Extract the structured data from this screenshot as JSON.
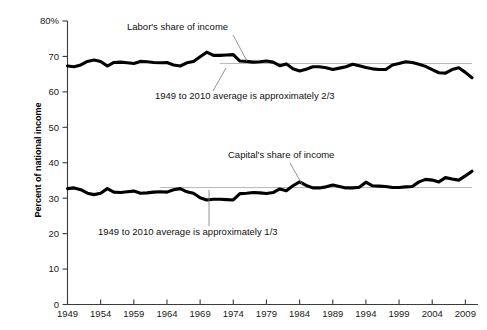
{
  "chart_data": {
    "type": "line",
    "title": "",
    "xlabel": "",
    "ylabel": "Percent of national income",
    "xlim": [
      1949,
      2010
    ],
    "ylim": [
      0,
      80
    ],
    "grid": false,
    "legend_position": "inline-annotations",
    "ytick_labels": [
      "0",
      "10",
      "20",
      "30",
      "40",
      "50",
      "60",
      "70",
      "80%"
    ],
    "ytick_values": [
      0,
      10,
      20,
      30,
      40,
      50,
      60,
      70,
      80
    ],
    "xtick_labels": [
      "1949",
      "1954",
      "1959",
      "1964",
      "1969",
      "1974",
      "1979",
      "1984",
      "1989",
      "1994",
      "1999",
      "2004",
      "2009"
    ],
    "xtick_values": [
      1949,
      1954,
      1959,
      1964,
      1969,
      1974,
      1979,
      1984,
      1989,
      1994,
      1999,
      2004,
      2009
    ],
    "x": [
      1949,
      1950,
      1951,
      1952,
      1953,
      1954,
      1955,
      1956,
      1957,
      1958,
      1959,
      1960,
      1961,
      1962,
      1963,
      1964,
      1965,
      1966,
      1967,
      1968,
      1969,
      1970,
      1971,
      1972,
      1973,
      1974,
      1975,
      1976,
      1977,
      1978,
      1979,
      1980,
      1981,
      1982,
      1983,
      1984,
      1985,
      1986,
      1987,
      1988,
      1989,
      1990,
      1991,
      1992,
      1993,
      1994,
      1995,
      1996,
      1997,
      1998,
      1999,
      2000,
      2001,
      2002,
      2003,
      2004,
      2005,
      2006,
      2007,
      2008,
      2009,
      2010
    ],
    "series": [
      {
        "name": "Labor's share of income",
        "color": "#000000",
        "values": [
          67.3,
          67.1,
          67.6,
          68.6,
          69.0,
          68.6,
          67.3,
          68.3,
          68.4,
          68.2,
          68.0,
          68.6,
          68.5,
          68.3,
          68.2,
          68.3,
          67.6,
          67.3,
          68.2,
          68.6,
          69.9,
          71.2,
          70.3,
          70.3,
          70.4,
          70.5,
          68.7,
          68.6,
          68.4,
          68.5,
          68.7,
          68.4,
          67.4,
          67.9,
          66.5,
          65.9,
          66.4,
          67.1,
          67.1,
          66.8,
          66.3,
          66.7,
          67.1,
          67.8,
          67.4,
          66.9,
          66.5,
          66.3,
          66.3,
          67.6,
          68.0,
          68.5,
          68.3,
          67.8,
          67.2,
          66.3,
          65.4,
          65.3,
          66.3,
          66.8,
          65.5,
          64.0
        ]
      },
      {
        "name": "Capital's share of income",
        "color": "#000000",
        "values": [
          32.7,
          32.9,
          32.4,
          31.4,
          31.0,
          31.4,
          32.7,
          31.7,
          31.6,
          31.8,
          32.0,
          31.4,
          31.5,
          31.7,
          31.8,
          31.7,
          32.4,
          32.7,
          31.8,
          31.4,
          30.1,
          29.5,
          29.7,
          29.7,
          29.6,
          29.5,
          31.3,
          31.4,
          31.6,
          31.5,
          31.3,
          31.6,
          32.6,
          32.1,
          33.5,
          34.6,
          33.6,
          32.9,
          32.9,
          33.2,
          33.7,
          33.3,
          32.9,
          32.9,
          33.1,
          34.5,
          33.5,
          33.4,
          33.3,
          33.0,
          33.0,
          33.2,
          33.3,
          34.6,
          35.3,
          35.1,
          34.6,
          35.8,
          35.4,
          35.1,
          36.3,
          37.6
        ]
      }
    ],
    "reference_lines": [
      {
        "name": "labor-average",
        "value": 68.0,
        "label": "1949 to 2010 average is approximately 2/3",
        "x_start": 1972,
        "x_end": 2010,
        "color": "#b0b0b0"
      },
      {
        "name": "capital-average",
        "value": 33.0,
        "label": "1949 to 2010 average is approximately 1/3",
        "x_start": 1963,
        "x_end": 2010,
        "color": "#b0b0b0"
      }
    ],
    "annotations": [
      {
        "name": "labor-series-label",
        "text": "Labor's share of income",
        "text_x": 127,
        "text_y": 30,
        "leader": [
          [
            233,
            35
          ],
          [
            247,
            61
          ]
        ]
      },
      {
        "name": "labor-average-label",
        "text": "1949 to 2010 average is approximately 2/3",
        "text_x": 155,
        "text_y": 99,
        "leader": [
          [
            226,
            68
          ],
          [
            213,
            91
          ]
        ]
      },
      {
        "name": "capital-series-label",
        "text": "Capital's share of income",
        "text_x": 228,
        "text_y": 158,
        "leader": [
          [
            290,
            163
          ],
          [
            303,
            186
          ]
        ]
      },
      {
        "name": "capital-average-label",
        "text": "1949 to 2010 average is approximately 1/3",
        "text_x": 98,
        "text_y": 235,
        "leader": [
          [
            209,
            190
          ],
          [
            209,
            226
          ]
        ]
      }
    ]
  }
}
